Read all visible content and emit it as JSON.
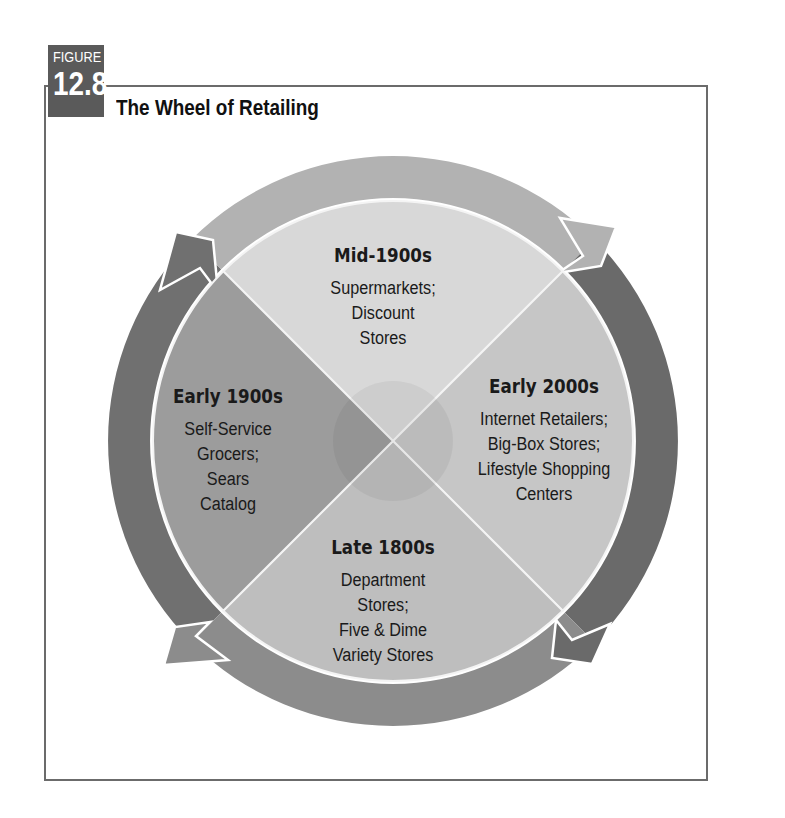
{
  "figure": {
    "label": "FIGURE",
    "number": "12.8",
    "title": "The Wheel of Retailing"
  },
  "wheel": {
    "direction": "clockwise",
    "segments": [
      {
        "position": "top",
        "era": "Mid-1900s",
        "lines": [
          "Supermarkets;",
          "Discount",
          "Stores"
        ],
        "fill": "#d8d8d8"
      },
      {
        "position": "right",
        "era": "Early 2000s",
        "lines": [
          "Internet Retailers;",
          "Big-Box Stores;",
          "Lifestyle Shopping",
          "Centers"
        ],
        "fill": "#c6c6c6"
      },
      {
        "position": "bottom",
        "era": "Late 1800s",
        "lines": [
          "Department",
          "Stores;",
          "Five & Dime",
          "Variety Stores"
        ],
        "fill": "#bebebe"
      },
      {
        "position": "left",
        "era": "Early 1900s",
        "lines": [
          "Self-Service",
          "Grocers;",
          "Sears",
          "Catalog"
        ],
        "fill": "#9c9c9c"
      }
    ],
    "ring_colors": {
      "top": "#b2b2b2",
      "right": "#6a6a6a",
      "bottom": "#8c8c8c",
      "left": "#707070"
    }
  }
}
